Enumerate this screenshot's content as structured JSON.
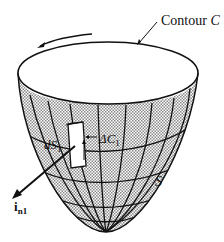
{
  "figure": {
    "labels": {
      "contour": {
        "word": "Contour",
        "symbol": "C"
      },
      "surface": "S",
      "element": {
        "symbol": "dS",
        "sub": "1"
      },
      "element_contour": {
        "symbol": "ΔC",
        "sub": "1"
      },
      "normal": {
        "symbol": "i",
        "sub": "n1"
      }
    },
    "colors": {
      "line": "#111111",
      "surface_fill": "#d8d8d8",
      "background": "#ffffff"
    }
  }
}
